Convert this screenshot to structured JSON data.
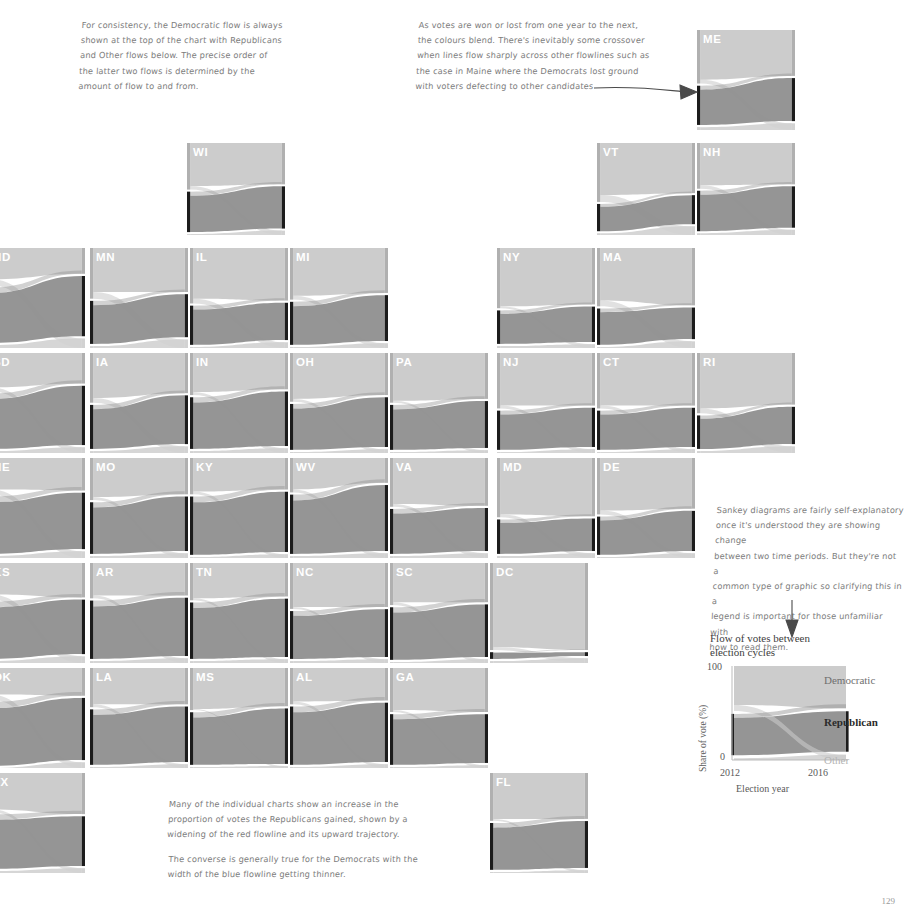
{
  "page": {
    "background": "#ffffff",
    "width": 901,
    "height": 908,
    "corner_number": "129"
  },
  "colors": {
    "democratic": "#b0b0b0",
    "republican": "#7d7d7d",
    "other": "#d2d2d2",
    "flow_light": "#c9c9c9",
    "flow_dark": "#8f8f8f",
    "node_bar": "#1c1c1c",
    "label": "#ffffff",
    "note_text": "#7c7c7c",
    "axis_text": "#5a5a5a"
  },
  "annotations": [
    {
      "name": "note-consistency",
      "x": 80,
      "y": 18,
      "width": 300,
      "text": "For consistency, the Democratic flow is always\nshown at the top of the chart with Republicans\nand Other flows below. The precise order of\nthe latter two flows is determined by the\namount of flow to and from."
    },
    {
      "name": "note-maine-crossover",
      "x": 417,
      "y": 18,
      "width": 275,
      "text": "As votes are won or lost from one year to the next,\nthe colours blend. There's inevitably some crossover\nwhen lines flow sharply across other flowlines such as\nthe case in Maine where the Democrats lost ground\nwith voters defecting to other candidates"
    },
    {
      "name": "note-sankey-legend",
      "x": 713,
      "y": 503,
      "width": 190,
      "text": "Sankey diagrams are fairly self-explanatory\nonce it's understood they are showing change\nbetween two time periods. But they're not a\ncommon type of graphic so clarifying this in a\nlegend is important for those unfamiliar with\nhow to read them."
    },
    {
      "name": "note-republican-gain",
      "x": 168,
      "y": 797,
      "width": 290,
      "text": "Many of the individual charts show an increase in the\nproportion of votes the Republicans gained, shown by a\nwidening of the red flowline and its upward trajectory."
    },
    {
      "name": "note-democrat-loss",
      "x": 168,
      "y": 852,
      "width": 290,
      "text": "The converse is generally true for the Democrats with the\nwidth of the blue flowline getting thinner."
    }
  ],
  "legend": {
    "title": "Flow of votes between\nelection cycles",
    "series_labels": {
      "democratic": "Democratic",
      "republican": "Republican",
      "other": "Other"
    },
    "y_axis": {
      "label": "Share of vote (%)",
      "ticks": [
        "100",
        "0"
      ],
      "min": 0,
      "max": 100
    },
    "x_axis": {
      "label": "Election year",
      "ticks": [
        "2012",
        "2016"
      ]
    }
  },
  "chart_data": {
    "type": "sankey",
    "title": "Flow of votes between election cycles",
    "xlabel": "Election year",
    "ylabel": "Share of vote (%)",
    "ylim": [
      0,
      100
    ],
    "x": [
      "2012",
      "2016"
    ],
    "legend_position": "right",
    "grid": false,
    "series": [
      {
        "name": "Democratic",
        "color": "#b0b0b0",
        "values": [
          51,
          48
        ]
      },
      {
        "name": "Republican",
        "color": "#7d7d7d",
        "values": [
          47,
          46
        ]
      },
      {
        "name": "Other",
        "color": "#d2d2d2",
        "values": [
          2,
          6
        ]
      }
    ],
    "small_multiples_note": "Each small multiple is a state-level Sankey of vote share 2012 -> 2016",
    "panels": [
      {
        "code": "ME",
        "row": 0,
        "col": 8,
        "x": 697,
        "y": 30,
        "w": 98,
        "h": 100,
        "left": {
          "dem": 56,
          "rep": 41,
          "oth": 3
        },
        "right": {
          "dem": 48,
          "rep": 45,
          "oth": 7
        }
      },
      {
        "code": "WI",
        "row": 1,
        "col": 2,
        "x": 187,
        "y": 143,
        "w": 98,
        "h": 92,
        "left": {
          "dem": 53,
          "rep": 46,
          "oth": 1
        },
        "right": {
          "dem": 47,
          "rep": 48,
          "oth": 5
        }
      },
      {
        "code": "VT",
        "row": 1,
        "col": 7,
        "x": 597,
        "y": 143,
        "w": 98,
        "h": 92,
        "left": {
          "dem": 67,
          "rep": 31,
          "oth": 2
        },
        "right": {
          "dem": 57,
          "rep": 33,
          "oth": 10
        }
      },
      {
        "code": "NH",
        "row": 1,
        "col": 8,
        "x": 697,
        "y": 143,
        "w": 98,
        "h": 92,
        "left": {
          "dem": 52,
          "rep": 46,
          "oth": 2
        },
        "right": {
          "dem": 47,
          "rep": 47,
          "oth": 6
        }
      },
      {
        "code": "ND",
        "row": 2,
        "col": 0,
        "x": -13,
        "y": 248,
        "w": 98,
        "h": 100,
        "left": {
          "dem": 39,
          "rep": 58,
          "oth": 3
        },
        "right": {
          "dem": 27,
          "rep": 63,
          "oth": 10
        }
      },
      {
        "code": "MN",
        "row": 2,
        "col": 1,
        "x": 90,
        "y": 248,
        "w": 98,
        "h": 100,
        "left": {
          "dem": 53,
          "rep": 45,
          "oth": 2
        },
        "right": {
          "dem": 46,
          "rep": 45,
          "oth": 9
        }
      },
      {
        "code": "IL",
        "row": 2,
        "col": 2,
        "x": 190,
        "y": 248,
        "w": 98,
        "h": 100,
        "left": {
          "dem": 58,
          "rep": 41,
          "oth": 1
        },
        "right": {
          "dem": 55,
          "rep": 39,
          "oth": 6
        }
      },
      {
        "code": "MI",
        "row": 2,
        "col": 3,
        "x": 290,
        "y": 248,
        "w": 98,
        "h": 100,
        "left": {
          "dem": 54,
          "rep": 45,
          "oth": 1
        },
        "right": {
          "dem": 47,
          "rep": 48,
          "oth": 5
        }
      },
      {
        "code": "NY",
        "row": 2,
        "col": 6,
        "x": 497,
        "y": 248,
        "w": 98,
        "h": 100,
        "left": {
          "dem": 63,
          "rep": 35,
          "oth": 2
        },
        "right": {
          "dem": 59,
          "rep": 37,
          "oth": 4
        }
      },
      {
        "code": "MA",
        "row": 2,
        "col": 7,
        "x": 597,
        "y": 248,
        "w": 98,
        "h": 100,
        "left": {
          "dem": 61,
          "rep": 38,
          "oth": 1
        },
        "right": {
          "dem": 60,
          "rep": 33,
          "oth": 7
        }
      },
      {
        "code": "SD",
        "row": 3,
        "col": 0,
        "x": -13,
        "y": 353,
        "w": 98,
        "h": 100,
        "left": {
          "dem": 40,
          "rep": 58,
          "oth": 2
        },
        "right": {
          "dem": 32,
          "rep": 62,
          "oth": 6
        }
      },
      {
        "code": "IA",
        "row": 3,
        "col": 1,
        "x": 90,
        "y": 353,
        "w": 98,
        "h": 100,
        "left": {
          "dem": 52,
          "rep": 46,
          "oth": 2
        },
        "right": {
          "dem": 42,
          "rep": 51,
          "oth": 7
        }
      },
      {
        "code": "IN",
        "row": 3,
        "col": 2,
        "x": 190,
        "y": 353,
        "w": 98,
        "h": 100,
        "left": {
          "dem": 44,
          "rep": 54,
          "oth": 2
        },
        "right": {
          "dem": 38,
          "rep": 57,
          "oth": 5
        }
      },
      {
        "code": "OH",
        "row": 3,
        "col": 3,
        "x": 290,
        "y": 353,
        "w": 98,
        "h": 100,
        "left": {
          "dem": 51,
          "rep": 48,
          "oth": 1
        },
        "right": {
          "dem": 44,
          "rep": 52,
          "oth": 4
        }
      },
      {
        "code": "PA",
        "row": 3,
        "col": 4,
        "x": 390,
        "y": 353,
        "w": 98,
        "h": 100,
        "left": {
          "dem": 52,
          "rep": 47,
          "oth": 1
        },
        "right": {
          "dem": 48,
          "rep": 49,
          "oth": 3
        }
      },
      {
        "code": "NJ",
        "row": 3,
        "col": 5,
        "x": 497,
        "y": 353,
        "w": 98,
        "h": 100,
        "left": {
          "dem": 58,
          "rep": 41,
          "oth": 1
        },
        "right": {
          "dem": 55,
          "rep": 41,
          "oth": 4
        }
      },
      {
        "code": "CT",
        "row": 3,
        "col": 6,
        "x": 597,
        "y": 353,
        "w": 98,
        "h": 100,
        "left": {
          "dem": 58,
          "rep": 41,
          "oth": 1
        },
        "right": {
          "dem": 55,
          "rep": 41,
          "oth": 4
        }
      },
      {
        "code": "RI",
        "row": 3,
        "col": 7,
        "x": 697,
        "y": 353,
        "w": 98,
        "h": 100,
        "left": {
          "dem": 63,
          "rep": 35,
          "oth": 2
        },
        "right": {
          "dem": 54,
          "rep": 39,
          "oth": 7
        }
      },
      {
        "code": "NE",
        "row": 4,
        "col": 0,
        "x": -13,
        "y": 458,
        "w": 98,
        "h": 100,
        "left": {
          "dem": 38,
          "rep": 60,
          "oth": 2
        },
        "right": {
          "dem": 34,
          "rep": 59,
          "oth": 7
        }
      },
      {
        "code": "MO",
        "row": 4,
        "col": 1,
        "x": 90,
        "y": 458,
        "w": 98,
        "h": 100,
        "left": {
          "dem": 44,
          "rep": 54,
          "oth": 2
        },
        "right": {
          "dem": 38,
          "rep": 57,
          "oth": 5
        }
      },
      {
        "code": "KY",
        "row": 4,
        "col": 2,
        "x": 190,
        "y": 458,
        "w": 98,
        "h": 100,
        "left": {
          "dem": 38,
          "rep": 61,
          "oth": 1
        },
        "right": {
          "dem": 33,
          "rep": 63,
          "oth": 4
        }
      },
      {
        "code": "WV",
        "row": 4,
        "col": 3,
        "x": 290,
        "y": 458,
        "w": 98,
        "h": 100,
        "left": {
          "dem": 36,
          "rep": 62,
          "oth": 2
        },
        "right": {
          "dem": 26,
          "rep": 69,
          "oth": 5
        }
      },
      {
        "code": "VA",
        "row": 4,
        "col": 4,
        "x": 390,
        "y": 458,
        "w": 98,
        "h": 100,
        "left": {
          "dem": 51,
          "rep": 47,
          "oth": 2
        },
        "right": {
          "dem": 50,
          "rep": 45,
          "oth": 5
        }
      },
      {
        "code": "MD",
        "row": 4,
        "col": 5,
        "x": 497,
        "y": 458,
        "w": 98,
        "h": 100,
        "left": {
          "dem": 62,
          "rep": 36,
          "oth": 2
        },
        "right": {
          "dem": 61,
          "rep": 34,
          "oth": 5
        }
      },
      {
        "code": "DE",
        "row": 4,
        "col": 6,
        "x": 597,
        "y": 458,
        "w": 98,
        "h": 100,
        "left": {
          "dem": 59,
          "rep": 40,
          "oth": 1
        },
        "right": {
          "dem": 53,
          "rep": 42,
          "oth": 5
        }
      },
      {
        "code": "KS",
        "row": 5,
        "col": 0,
        "x": -13,
        "y": 563,
        "w": 98,
        "h": 100,
        "left": {
          "dem": 38,
          "rep": 60,
          "oth": 2
        },
        "right": {
          "dem": 36,
          "rep": 57,
          "oth": 7
        }
      },
      {
        "code": "AR",
        "row": 5,
        "col": 1,
        "x": 90,
        "y": 563,
        "w": 98,
        "h": 100,
        "left": {
          "dem": 37,
          "rep": 61,
          "oth": 2
        },
        "right": {
          "dem": 34,
          "rep": 61,
          "oth": 5
        }
      },
      {
        "code": "TN",
        "row": 5,
        "col": 2,
        "x": 190,
        "y": 563,
        "w": 98,
        "h": 100,
        "left": {
          "dem": 39,
          "rep": 59,
          "oth": 2
        },
        "right": {
          "dem": 35,
          "rep": 61,
          "oth": 4
        }
      },
      {
        "code": "NC",
        "row": 5,
        "col": 3,
        "x": 290,
        "y": 563,
        "w": 98,
        "h": 100,
        "left": {
          "dem": 48,
          "rep": 50,
          "oth": 2
        },
        "right": {
          "dem": 46,
          "rep": 50,
          "oth": 4
        }
      },
      {
        "code": "SC",
        "row": 5,
        "col": 4,
        "x": 390,
        "y": 563,
        "w": 98,
        "h": 100,
        "left": {
          "dem": 44,
          "rep": 55,
          "oth": 1
        },
        "right": {
          "dem": 41,
          "rep": 55,
          "oth": 4
        }
      },
      {
        "code": "DC",
        "row": 5,
        "col": 5,
        "x": 490,
        "y": 563,
        "w": 98,
        "h": 100,
        "left": {
          "dem": 91,
          "rep": 7,
          "oth": 2
        },
        "right": {
          "dem": 91,
          "rep": 4,
          "oth": 5
        }
      },
      {
        "code": "OK",
        "row": 6,
        "col": 0,
        "x": -13,
        "y": 668,
        "w": 98,
        "h": 100,
        "left": {
          "dem": 33,
          "rep": 67,
          "oth": 0
        },
        "right": {
          "dem": 29,
          "rep": 65,
          "oth": 6
        }
      },
      {
        "code": "LA",
        "row": 6,
        "col": 1,
        "x": 90,
        "y": 668,
        "w": 98,
        "h": 100,
        "left": {
          "dem": 41,
          "rep": 58,
          "oth": 1
        },
        "right": {
          "dem": 38,
          "rep": 58,
          "oth": 4
        }
      },
      {
        "code": "MS",
        "row": 6,
        "col": 2,
        "x": 190,
        "y": 668,
        "w": 98,
        "h": 100,
        "left": {
          "dem": 44,
          "rep": 55,
          "oth": 1
        },
        "right": {
          "dem": 40,
          "rep": 58,
          "oth": 2
        }
      },
      {
        "code": "AL",
        "row": 6,
        "col": 3,
        "x": 290,
        "y": 668,
        "w": 98,
        "h": 100,
        "left": {
          "dem": 38,
          "rep": 61,
          "oth": 1
        },
        "right": {
          "dem": 34,
          "rep": 62,
          "oth": 4
        }
      },
      {
        "code": "GA",
        "row": 6,
        "col": 4,
        "x": 390,
        "y": 668,
        "w": 98,
        "h": 100,
        "left": {
          "dem": 46,
          "rep": 53,
          "oth": 1
        },
        "right": {
          "dem": 46,
          "rep": 51,
          "oth": 3
        }
      },
      {
        "code": "TX",
        "row": 7,
        "col": 0,
        "x": -13,
        "y": 773,
        "w": 98,
        "h": 100,
        "left": {
          "dem": 41,
          "rep": 57,
          "oth": 2
        },
        "right": {
          "dem": 43,
          "rep": 52,
          "oth": 5
        }
      },
      {
        "code": "FL",
        "row": 7,
        "col": 4,
        "x": 490,
        "y": 773,
        "w": 98,
        "h": 100,
        "left": {
          "dem": 50,
          "rep": 49,
          "oth": 1
        },
        "right": {
          "dem": 48,
          "rep": 49,
          "oth": 3
        }
      }
    ]
  }
}
